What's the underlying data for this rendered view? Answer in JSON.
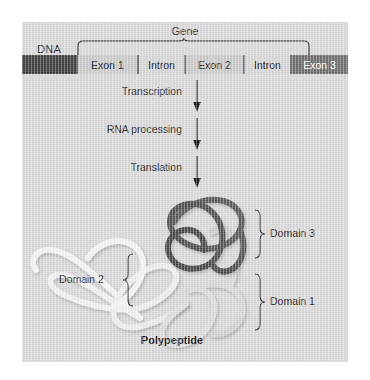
{
  "figure": {
    "background_color": "#d8d8d8",
    "dna_label": "DNA",
    "gene_label": "Gene",
    "caption": "Polypeptide"
  },
  "dna": {
    "segments": [
      {
        "label": "",
        "type": "flank",
        "width": 66
      },
      {
        "label": "Exon 1",
        "type": "exon",
        "width": 60
      },
      {
        "label": "Intron",
        "type": "intron",
        "width": 46
      },
      {
        "label": "Exon 2",
        "type": "exon",
        "width": 58
      },
      {
        "label": "Intron",
        "type": "intron",
        "width": 46
      },
      {
        "label": "Exon 3",
        "type": "exon-highlight",
        "width": 58
      },
      {
        "label": "",
        "type": "flank",
        "width": 66
      }
    ],
    "bar_color": "#3a3a3a",
    "exon_color": "#c9c9c9",
    "intron_color": "#d5d5d5",
    "exon3_color": "#6a6a6a"
  },
  "steps": [
    {
      "label": "Transcription",
      "y": 70
    },
    {
      "label": "RNA processing",
      "y": 108
    },
    {
      "label": "Translation",
      "y": 146
    }
  ],
  "domains": [
    {
      "label": "Domain 3",
      "color": "#4a4a4a",
      "side": "right"
    },
    {
      "label": "Domain 2",
      "color": "#f2f2f2",
      "side": "left"
    },
    {
      "label": "Domain 1",
      "color": "#cfcfcf",
      "side": "right"
    }
  ]
}
